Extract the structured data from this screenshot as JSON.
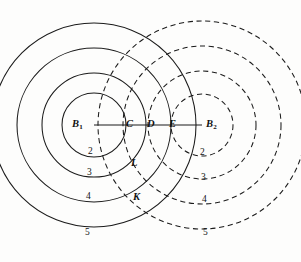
{
  "figure": {
    "width": 301,
    "height": 262,
    "background_color": "#fdfdfc",
    "stroke_color": "#1b1b1b"
  },
  "sources": [
    {
      "id": "B1",
      "label": "B",
      "subscript": "1",
      "name": "source-b1",
      "cx": 94,
      "cy": 125,
      "line_style": "solid",
      "label_x": 72,
      "label_y": 119
    },
    {
      "id": "B2",
      "label": "B",
      "subscript": "2",
      "name": "source-b2",
      "cx": 202,
      "cy": 125,
      "line_style": "dashed",
      "label_x": 206,
      "label_y": 119
    }
  ],
  "axis": {
    "name": "baseline-segment",
    "x1": 94,
    "y1": 125,
    "x2": 202,
    "y2": 125
  },
  "wavefronts": {
    "b1_solid_radii": [
      32,
      52,
      77,
      102
    ],
    "b2_dashed_radii": [
      31,
      54,
      79,
      104
    ],
    "b1_order_labels": [
      "2",
      "3",
      "4",
      "5"
    ],
    "b2_order_labels": [
      "2",
      "3",
      "4",
      "5"
    ]
  },
  "axis_points": [
    {
      "label": "C",
      "name": "point-c",
      "x": 126,
      "y": 119
    },
    {
      "label": "D",
      "name": "point-d",
      "x": 147,
      "y": 119
    },
    {
      "label": "E",
      "name": "point-e",
      "x": 169,
      "y": 119
    }
  ],
  "intersection_points": [
    {
      "label": "L",
      "name": "point-l",
      "x": 131,
      "y": 158
    },
    {
      "label": "K",
      "name": "point-k",
      "x": 133,
      "y": 192
    }
  ],
  "order_labels_left": [
    {
      "text": "2",
      "name": "order-label-left-2",
      "x": 88,
      "y": 147
    },
    {
      "text": "3",
      "name": "order-label-left-3",
      "x": 87,
      "y": 168
    },
    {
      "text": "4",
      "name": "order-label-left-4",
      "x": 86,
      "y": 192
    },
    {
      "text": "5",
      "name": "order-label-left-5",
      "x": 85,
      "y": 228
    }
  ],
  "order_labels_right": [
    {
      "text": "2",
      "name": "order-label-right-2",
      "x": 200,
      "y": 148
    },
    {
      "text": "3",
      "name": "order-label-right-3",
      "x": 201,
      "y": 173
    },
    {
      "text": "4",
      "name": "order-label-right-4",
      "x": 202,
      "y": 195
    },
    {
      "text": "5",
      "name": "order-label-right-5",
      "x": 203,
      "y": 228
    }
  ]
}
